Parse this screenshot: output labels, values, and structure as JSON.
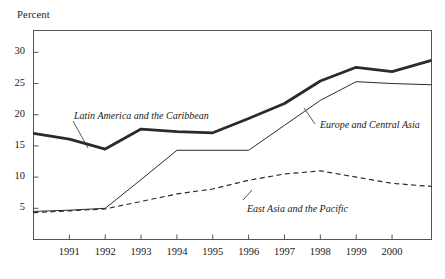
{
  "chart_data": {
    "type": "line",
    "title": "",
    "subtitle": "",
    "xlabel": "",
    "ylabel": "Percent",
    "ylim": [
      0,
      33.5
    ],
    "xlim": [
      1990.0,
      2001.1
    ],
    "grid": false,
    "legend_position": "inline-annotations",
    "x_tick_labels": [
      "1991",
      "1992",
      "1993",
      "1994",
      "1995",
      "1996",
      "1997",
      "1998",
      "1999",
      "2000"
    ],
    "x": [
      1991,
      1992,
      1993,
      1994,
      1995,
      1996,
      1997,
      1998,
      1999,
      2000
    ],
    "y_tick_labels": [
      "5",
      "10",
      "15",
      "20",
      "25",
      "30"
    ],
    "y_ticks": [
      5,
      10,
      15,
      20,
      25,
      30
    ],
    "series": [
      {
        "name": "Latin America and the Caribbean",
        "style": "thick-solid",
        "x": [
          1990.0,
          1991,
          1992,
          1993,
          1994,
          1995,
          1996,
          1997,
          1998,
          1999,
          2000,
          2001.1
        ],
        "values": [
          17.0,
          16.1,
          14.5,
          17.7,
          17.3,
          17.1,
          19.4,
          21.8,
          25.4,
          27.6,
          26.9,
          28.7
        ]
      },
      {
        "name": "Europe and Central Asia",
        "style": "thin-solid",
        "x": [
          1990.0,
          1991,
          1992,
          1993,
          1994,
          1995,
          1996,
          1997,
          1998,
          1999,
          2000,
          2001.1
        ],
        "values": [
          4.5,
          4.7,
          5.0,
          9.6,
          14.3,
          14.3,
          14.3,
          18.3,
          22.3,
          25.3,
          25.0,
          24.8
        ]
      },
      {
        "name": "East Asia and the Pacific",
        "style": "dashed",
        "x": [
          1990.0,
          1991,
          1992,
          1993,
          1994,
          1995,
          1996,
          1997,
          1998,
          1999,
          2000,
          2001.1
        ],
        "values": [
          4.3,
          4.6,
          4.9,
          6.1,
          7.3,
          8.1,
          9.5,
          10.5,
          11.0,
          10.0,
          9.0,
          8.5
        ]
      }
    ]
  },
  "axis": {
    "unit_label": "Percent"
  },
  "annotations": {
    "latin_america": "Latin America and the Caribbean",
    "europe_central_asia": "Europe and Central Asia",
    "east_asia_pacific": "East Asia and the Pacific"
  },
  "colors": {
    "line": "#2b2b2b",
    "frame": "#555555",
    "background": "#ffffff"
  }
}
